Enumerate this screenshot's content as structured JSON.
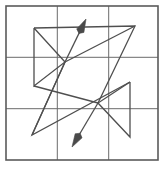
{
  "canvas": {
    "width": 165,
    "height": 169,
    "background": "#ffffff"
  },
  "figure": {
    "frame": {
      "x": 6,
      "y": 6,
      "width": 152,
      "height": 154,
      "stroke": "#5a5a5a",
      "stroke_width": 1.6
    },
    "grid": {
      "rows": 3,
      "cols": 3,
      "stroke": "#6b6b6b",
      "stroke_width": 1,
      "vertical_x": [
        57.3,
        108.7
      ],
      "horizontal_y": [
        57.3,
        108.7
      ]
    },
    "stroke": "#4f4f4f",
    "stroke_width": 1.3,
    "node_a": {
      "x": 65,
      "y": 62,
      "label": "upper-left-hub"
    },
    "node_b": {
      "x": 98,
      "y": 103,
      "label": "lower-right-hub"
    },
    "paths": [
      {
        "name": "left-triangle",
        "points": [
          [
            34,
            28
          ],
          [
            34,
            86
          ],
          [
            65,
            62
          ],
          [
            34,
            28
          ]
        ],
        "closed": true
      },
      {
        "name": "right-triangle",
        "points": [
          [
            130,
            82
          ],
          [
            130,
            137
          ],
          [
            98,
            103
          ],
          [
            130,
            82
          ]
        ],
        "closed": true
      },
      {
        "name": "upper-long-zigzag",
        "points": [
          [
            34,
            28
          ],
          [
            135,
            26
          ],
          [
            98,
            103
          ]
        ],
        "closed": false
      },
      {
        "name": "lower-long-zigzag",
        "points": [
          [
            130,
            82
          ],
          [
            32,
            135
          ],
          [
            65,
            62
          ]
        ],
        "closed": false
      },
      {
        "name": "left-lower-leg",
        "points": [
          [
            34,
            86
          ],
          [
            98,
            103
          ]
        ],
        "closed": false
      },
      {
        "name": "right-upper-leg",
        "points": [
          [
            135,
            26
          ],
          [
            65,
            62
          ]
        ],
        "closed": false
      },
      {
        "name": "down-left-leg",
        "points": [
          [
            32,
            135
          ],
          [
            65,
            62
          ]
        ],
        "closed": false
      }
    ],
    "arrows": [
      {
        "name": "arrow-up-right",
        "from": [
          65,
          62
        ],
        "to": [
          86,
          19
        ],
        "direction": "up-right",
        "head_length": 13,
        "head_width": 8,
        "fill": "#4a4a4a"
      },
      {
        "name": "arrow-down-left",
        "from": [
          98,
          103
        ],
        "to": [
          72,
          147
        ],
        "direction": "down-left",
        "head_length": 13,
        "head_width": 8,
        "fill": "#4a4a4a"
      }
    ]
  }
}
